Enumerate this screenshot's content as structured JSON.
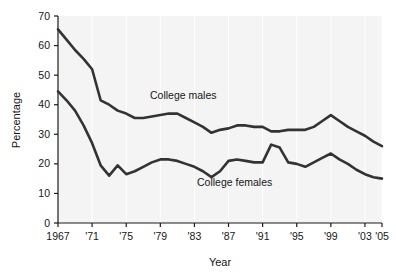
{
  "chart_data": {
    "type": "line",
    "title": "",
    "xlabel": "Year",
    "ylabel": "Percentage",
    "xlim": [
      1967,
      2005
    ],
    "ylim": [
      0,
      70
    ],
    "ytick_labels": [
      "0",
      "10",
      "20",
      "30",
      "40",
      "50",
      "60",
      "70"
    ],
    "yticks": [
      0,
      10,
      20,
      30,
      40,
      50,
      60,
      70
    ],
    "xtick_labels": [
      "1967",
      "'71",
      "'75",
      "'79",
      "'83",
      "'87",
      "'91",
      "'95",
      "'99",
      "'03",
      "'05"
    ],
    "xticks": [
      1967,
      1971,
      1975,
      1979,
      1983,
      1987,
      1991,
      1995,
      1999,
      2003,
      2005
    ],
    "grid": "vertical-only",
    "legend": "inline-annotations",
    "x": [
      1967,
      1968,
      1969,
      1970,
      1971,
      1972,
      1973,
      1974,
      1975,
      1976,
      1977,
      1978,
      1979,
      1980,
      1981,
      1982,
      1983,
      1984,
      1985,
      1986,
      1987,
      1988,
      1989,
      1990,
      1991,
      1992,
      1993,
      1994,
      1995,
      1996,
      1997,
      1998,
      1999,
      2000,
      2001,
      2002,
      2003,
      2004,
      2005
    ],
    "series": [
      {
        "name": "College males",
        "label": "College males",
        "color": "#333333",
        "values": [
          65.5,
          62.0,
          58.5,
          55.5,
          52.0,
          41.5,
          40.0,
          38.0,
          37.0,
          35.5,
          35.5,
          36.0,
          36.5,
          37.0,
          37.0,
          35.5,
          34.0,
          32.5,
          30.5,
          31.5,
          32.0,
          33.0,
          33.0,
          32.5,
          32.5,
          31.0,
          31.0,
          31.5,
          31.5,
          31.5,
          32.5,
          34.5,
          36.5,
          34.5,
          32.5,
          31.0,
          29.5,
          27.5,
          26.0
        ]
      },
      {
        "name": "College females",
        "label": "College females",
        "color": "#333333",
        "values": [
          44.5,
          41.5,
          38.0,
          33.0,
          27.0,
          19.5,
          16.0,
          19.5,
          16.5,
          17.5,
          19.0,
          20.5,
          21.5,
          21.5,
          21.0,
          20.0,
          19.0,
          17.5,
          15.5,
          17.5,
          21.0,
          21.5,
          21.0,
          20.5,
          20.5,
          26.5,
          25.5,
          20.5,
          20.0,
          19.0,
          20.5,
          22.0,
          23.5,
          21.5,
          20.0,
          18.0,
          16.5,
          15.5,
          15.0
        ]
      }
    ],
    "annotations": [
      {
        "text": "College males",
        "x_px": 150,
        "y_px": 99
      },
      {
        "text": "College females",
        "x_px": 197,
        "y_px": 186
      }
    ]
  }
}
